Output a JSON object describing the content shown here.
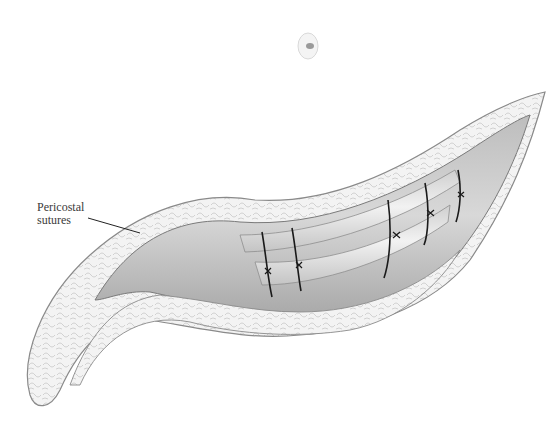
{
  "figure": {
    "callouts": [
      {
        "id": "pericostal-sutures",
        "lines": [
          "Pericostal",
          "sutures"
        ]
      }
    ],
    "suture_count": 5,
    "colors": {
      "background": "#ffffff",
      "tissue_outline": "#8a8a8a",
      "fat_fill": "#f1f1f1",
      "muscle_fill": "#cfcfcf",
      "rib_fill": "#e6e6e6",
      "suture": "#1a1a1a",
      "label_text": "#3a3a3a"
    }
  }
}
